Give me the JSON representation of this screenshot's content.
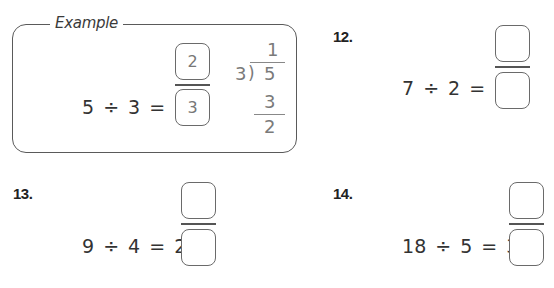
{
  "example": {
    "title": "Example",
    "dividend": "5",
    "divide_symbol": "÷",
    "divisor": "3",
    "equals": "=",
    "whole": "1",
    "numerator": "2",
    "denominator": "3",
    "long_division": {
      "divisor": "3",
      "bracket": ")",
      "dividend": "5",
      "quotient": "1",
      "subtract": "3",
      "remainder": "2"
    }
  },
  "problems": [
    {
      "number": "12.",
      "dividend": "7",
      "divide_symbol": "÷",
      "divisor": "2",
      "equals": "=",
      "whole": "3",
      "numerator": "",
      "denominator": ""
    },
    {
      "number": "13.",
      "dividend": "9",
      "divide_symbol": "÷",
      "divisor": "4",
      "equals": "=",
      "whole": "2",
      "numerator": "",
      "denominator": ""
    },
    {
      "number": "14.",
      "dividend": "18",
      "divide_symbol": "÷",
      "divisor": "5",
      "equals": "=",
      "whole": "3",
      "numerator": "",
      "denominator": ""
    }
  ]
}
